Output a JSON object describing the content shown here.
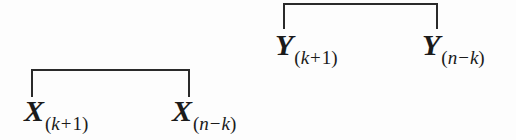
{
  "figure": {
    "ink_color": "#2a2a2a",
    "background_color": "#fdfdfd",
    "groups": [
      {
        "id": "x-group",
        "symbol": "X",
        "bracket": {
          "left": 31,
          "top": 69,
          "width": 159,
          "height": 28
        },
        "left_label": {
          "variable": "X",
          "subscript_open": "(",
          "subscript_index": "k",
          "subscript_operator": "+",
          "subscript_operand": "1",
          "subscript_close": ")",
          "full_text": "X(k + 1)"
        },
        "right_label": {
          "variable": "X",
          "subscript_open": "(",
          "subscript_index": "n",
          "subscript_operator": "−",
          "subscript_operand": "k",
          "subscript_close": ")",
          "full_text": "X(n − k)"
        }
      },
      {
        "id": "y-group",
        "symbol": "Y",
        "bracket": {
          "left": 283,
          "top": 3,
          "width": 155,
          "height": 26
        },
        "left_label": {
          "variable": "Y",
          "subscript_open": "(",
          "subscript_index": "k",
          "subscript_operator": "+",
          "subscript_operand": "1",
          "subscript_close": ")",
          "full_text": "Y(k + 1)"
        },
        "right_label": {
          "variable": "Y",
          "subscript_open": "(",
          "subscript_index": "n",
          "subscript_operator": "−",
          "subscript_operand": "k",
          "subscript_close": ")",
          "full_text": "Y(n − k)"
        }
      }
    ]
  }
}
